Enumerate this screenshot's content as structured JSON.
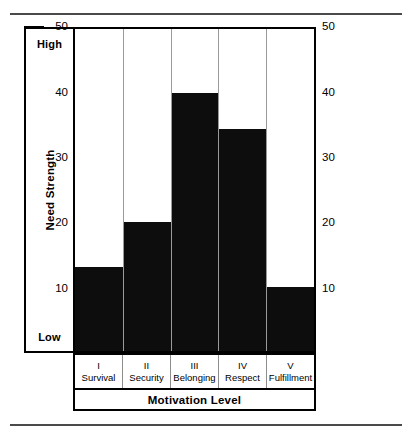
{
  "figure": {
    "name": "need-strength-vs-motivation-level-bar-chart"
  },
  "yaxis": {
    "title": "Need Strength",
    "high_label": "High",
    "low_label": "Low",
    "ticks": [
      "50",
      "40",
      "30",
      "20",
      "10"
    ],
    "tick_values": [
      50,
      40,
      30,
      20,
      10
    ]
  },
  "yaxis_right": {
    "ticks": [
      "50",
      "40",
      "30",
      "20",
      "10"
    ]
  },
  "xaxis": {
    "title": "Motivation Level",
    "categories": [
      {
        "roman": "I",
        "name": "Survival"
      },
      {
        "roman": "II",
        "name": "Security"
      },
      {
        "roman": "III",
        "name": "Belonging"
      },
      {
        "roman": "IV",
        "name": "Respect"
      },
      {
        "roman": "V",
        "name": "Fulfillment"
      }
    ]
  },
  "colors": {
    "bar": "#0d0d0d",
    "frame": "#000000",
    "gridline": "#9a9a9a",
    "rule": "#4a4a4a",
    "background": "#ffffff"
  },
  "chart_data": {
    "type": "bar",
    "title": "",
    "xlabel": "Motivation Level",
    "ylabel": "Need Strength",
    "categories": [
      "I Survival",
      "II Security",
      "III Belonging",
      "IV Respect",
      "V Fulfillment"
    ],
    "values": [
      13,
      20,
      40,
      34.5,
      10
    ],
    "ylim": [
      0,
      50
    ],
    "yticks": [
      10,
      20,
      30,
      40,
      50
    ],
    "grid": false,
    "legend": false,
    "bar_color": "#0d0d0d",
    "axis_annotations": {
      "top": "High",
      "bottom": "Low"
    }
  }
}
